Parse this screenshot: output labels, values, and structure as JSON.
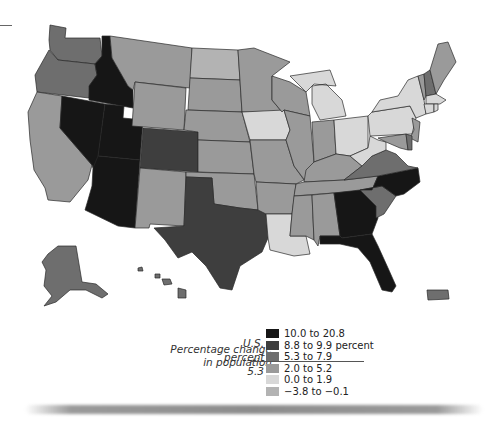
{
  "map": {
    "title": "Percentage change in population",
    "us_reference": {
      "label_line1": "U.S.",
      "label_line2": "percent",
      "value": "5.3"
    },
    "legend": {
      "title_line1": "Percentage change",
      "title_line2": "in population",
      "items": [
        {
          "label": "10.0 to 20.8",
          "color": "#161616"
        },
        {
          "label": "8.8 to 9.9 percent",
          "color": "#3e3e3e"
        },
        {
          "label": "5.3 to 7.9",
          "color": "#6e6e6e"
        },
        {
          "label": "2.0 to 5.2",
          "color": "#9a9a9a"
        },
        {
          "label": "0.0 to 1.9",
          "color": "#d8d8d8"
        },
        {
          "label": "−3.8 to −0.1",
          "color": "#b3b3b3"
        }
      ]
    },
    "states_by_class": {
      "10.0 to 20.8": [
        "Nevada",
        "Idaho",
        "Utah",
        "Arizona",
        "Georgia",
        "North Carolina",
        "Florida"
      ],
      "8.8 to 9.9 percent": [
        "Colorado",
        "Texas"
      ],
      "5.3 to 7.9": [
        "Washington",
        "Oregon",
        "South Carolina",
        "Virginia",
        "Delaware",
        "New Hampshire",
        "Alaska",
        "Hawaii"
      ],
      "2.0 to 5.2": [
        "California",
        "Montana",
        "Wyoming",
        "New Mexico",
        "Oklahoma",
        "Kansas",
        "Nebraska",
        "South Dakota",
        "Minnesota",
        "Wisconsin",
        "Missouri",
        "Arkansas",
        "Tennessee",
        "Mississippi",
        "Alabama",
        "Kentucky",
        "Illinois",
        "Indiana",
        "Vermont",
        "Maine",
        "New Jersey",
        "Maryland",
        "Puerto Rico"
      ],
      "0.0 to 1.9": [
        "Iowa",
        "Louisiana",
        "Michigan",
        "Ohio",
        "Pennsylvania",
        "New York",
        "West Virginia",
        "Massachusetts",
        "Connecticut",
        "Rhode Island"
      ],
      "−3.8 to −0.1": [
        "North Dakota"
      ]
    }
  }
}
